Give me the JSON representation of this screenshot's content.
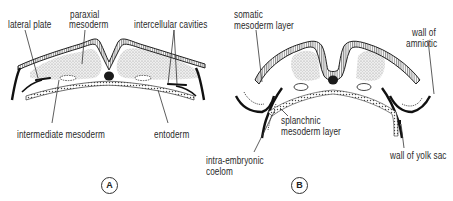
{
  "figure": {
    "panels": [
      {
        "tag": "A",
        "labels": {
          "lateral_plate": "lateral plate",
          "paraxial_mesoderm_1": "paraxial",
          "paraxial_mesoderm_2": "mesoderm",
          "intercellular_cavities": "intercellular cavities",
          "intermediate_mesoderm": "intermediate mesoderm",
          "entoderm": "entoderm"
        }
      },
      {
        "tag": "B",
        "labels": {
          "somatic_1": "somatic",
          "somatic_2": "mesoderm layer",
          "wall_amniotic_1": "wall of",
          "wall_amniotic_2": "amniotic",
          "splanchnic_1": "splanchnic",
          "splanchnic_2": "mesoderm layer",
          "coelom_1": "intra-embryonic",
          "coelom_2": "coelom",
          "yolk_sac": "wall of yolk sac"
        }
      }
    ],
    "colors": {
      "ink": "#222222",
      "stipple": "#c8c8c8",
      "background": "#ffffff"
    }
  }
}
